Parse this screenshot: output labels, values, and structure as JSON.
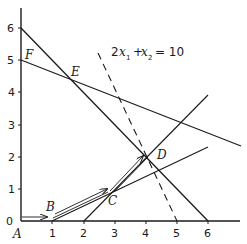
{
  "diagram": {
    "type": "linear-programming-graph",
    "equation_label": {
      "coef": "2",
      "x1": "x",
      "sub1": "1",
      "plus": "+",
      "x2": "x",
      "sub2": "2",
      "rhs": "= 10"
    },
    "x_ticks": [
      "1",
      "2",
      "3",
      "4",
      "5",
      "6"
    ],
    "y_ticks": [
      "0",
      "1",
      "2",
      "3",
      "4",
      "5",
      "6"
    ],
    "points": {
      "A": "A",
      "B": "B",
      "C": "C",
      "D": "D",
      "E": "E",
      "F": "F"
    },
    "colors": {
      "ink": "#1a1a1a",
      "background": "#ffffff"
    }
  }
}
